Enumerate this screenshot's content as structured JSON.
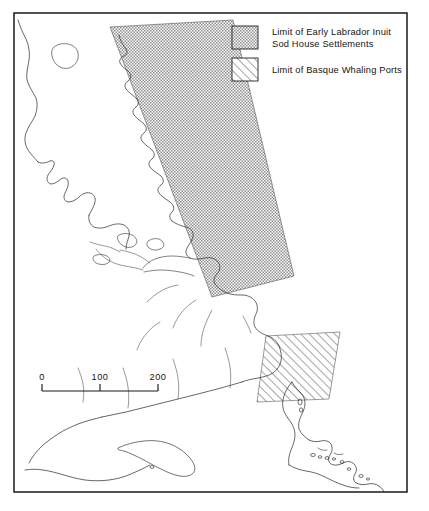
{
  "figure": {
    "kind": "thematic-map",
    "region": "Labrador and the Gulf of St. Lawrence",
    "background_color": "#ffffff",
    "frame_color": "#1a1a1a"
  },
  "legend": {
    "items": [
      {
        "id": "inuit-sod-house",
        "pattern": "stipple-dot",
        "label_line1": "Limit of Early Labrador Inuit",
        "label_line2": "Sod House Settlements"
      },
      {
        "id": "basque-whaling",
        "pattern": "diagonal-hatch",
        "label_line1": "Limit of Basque Whaling Ports",
        "label_line2": ""
      }
    ]
  },
  "scale_bar": {
    "unit": "",
    "ticks": [
      "0",
      "100",
      "200"
    ],
    "tick_values": [
      0,
      100,
      200
    ]
  }
}
